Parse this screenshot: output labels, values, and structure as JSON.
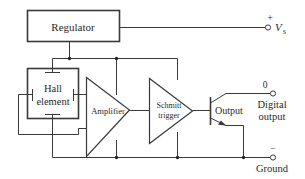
{
  "diagram": {
    "type": "block-diagram",
    "colors": {
      "line": "#3a3a3a",
      "background": "#ffffff",
      "text": "#2a2a2a"
    },
    "blocks": {
      "regulator": {
        "label": "Regulator"
      },
      "hall_element": {
        "label_line1": "Hall",
        "label_line2": "element"
      },
      "amplifier": {
        "label": "Amplifier"
      },
      "schmitt_trigger": {
        "label_line1": "Schmitt",
        "label_line2": "trigger"
      },
      "output_transistor": {
        "label": "Output"
      }
    },
    "terminals": {
      "supply": {
        "polarity": "+",
        "label": "V",
        "subscript": "s"
      },
      "digital_output": {
        "value": "0",
        "label_line1": "Digital",
        "label_line2": "output"
      },
      "ground": {
        "polarity": "–",
        "label": "Ground"
      }
    }
  }
}
